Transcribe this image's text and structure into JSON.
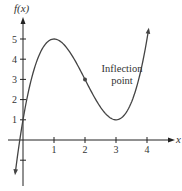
{
  "chart_data": {
    "type": "line",
    "title": "",
    "xlabel": "x",
    "ylabel": "f(x)",
    "x_ticks": [
      1,
      2,
      3,
      4
    ],
    "y_ticks": [
      -1,
      1,
      2,
      3,
      4,
      5
    ],
    "x_tick_labels": [
      "1",
      "2",
      "3",
      "4"
    ],
    "y_tick_labels": [
      "1",
      "2",
      "3",
      "4",
      "5"
    ],
    "xlim": [
      -0.5,
      5.0
    ],
    "ylim": [
      -2.0,
      6.5
    ],
    "grid": false,
    "function": "f(x) = (x-2)^3 - 3(x-2) + 3",
    "x_range": [
      -0.25,
      4.05
    ],
    "series": [
      {
        "name": "f(x)",
        "x": [
          -0.25,
          0,
          0.5,
          1,
          1.5,
          2,
          2.5,
          3,
          3.5,
          4,
          4.05
        ],
        "values": [
          -1.64,
          1,
          4.12,
          5,
          4.38,
          3,
          1.62,
          1,
          1.88,
          5,
          5.47
        ]
      }
    ],
    "key_points": {
      "local_max": [
        1,
        5
      ],
      "inflection": [
        2,
        3
      ],
      "local_min": [
        3,
        1
      ]
    },
    "annotations": [
      {
        "text_line1": "Inflection",
        "text_line2": "point",
        "target": [
          2,
          3
        ]
      }
    ],
    "colors": {
      "axis": "#222222",
      "curve": "#444444",
      "text": "#333333"
    }
  }
}
